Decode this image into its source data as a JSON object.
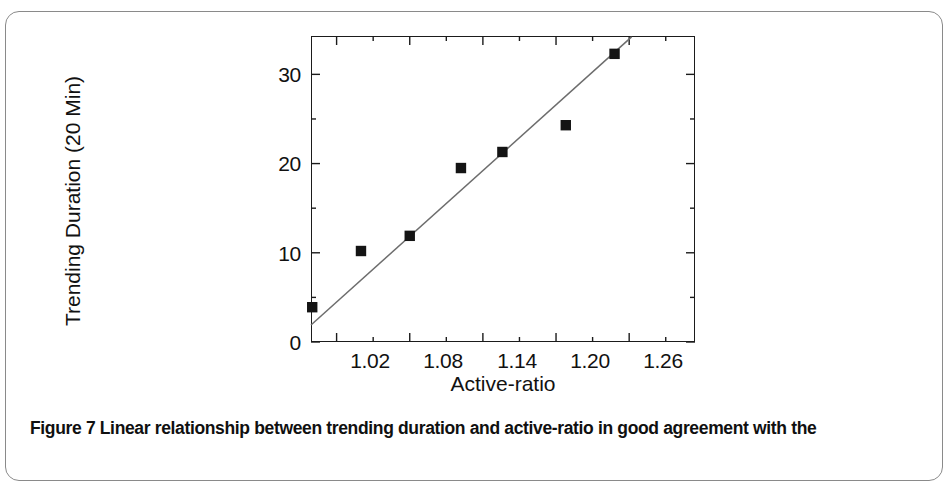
{
  "figure": {
    "caption": "Figure 7  Linear relationship between trending duration and active-ratio in good agreement with the"
  },
  "chart_data": {
    "type": "scatter",
    "title": "",
    "xlabel": "Active-ratio",
    "ylabel": "Trending Duration (20 Min)",
    "xlim": [
      0.999,
      1.314
    ],
    "ylim": [
      0,
      34.3
    ],
    "xticks": [
      1.02,
      1.08,
      1.14,
      1.2,
      1.26
    ],
    "xtick_labels": [
      "1.02",
      "1.08",
      "1.14",
      "1.20",
      "1.26"
    ],
    "xminor_step": 0.03,
    "yticks": [
      0,
      10,
      20,
      30
    ],
    "ytick_labels": [
      "0",
      "10",
      "20",
      "30"
    ],
    "yminor_step": 5,
    "grid": false,
    "legend": null,
    "series": [
      {
        "name": "Observed trending duration",
        "marker": "square",
        "marker_color": "#141414",
        "x": [
          1.0,
          1.04,
          1.08,
          1.122,
          1.156,
          1.208,
          1.248
        ],
        "y": [
          3.9,
          10.2,
          11.9,
          19.5,
          21.3,
          24.3,
          32.3
        ]
      },
      {
        "name": "Linear fit",
        "type": "line",
        "line_color": "#6d6d6d",
        "x": [
          0.999,
          1.262
        ],
        "y": [
          1.9,
          34.2
        ]
      }
    ]
  }
}
